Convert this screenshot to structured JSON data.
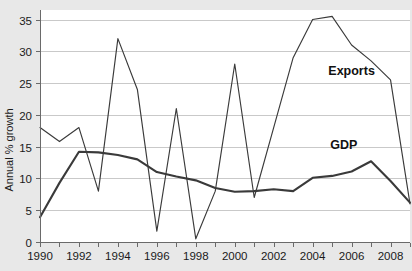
{
  "chart_data": {
    "type": "line",
    "title": "",
    "xlabel": "",
    "ylabel": "Annual % growth",
    "ylim": [
      0,
      36.5
    ],
    "xlim": [
      1990,
      2009
    ],
    "grid": true,
    "legend_position": "inline-labels",
    "y_ticks": [
      0,
      5,
      10,
      15,
      20,
      25,
      30,
      35
    ],
    "y_tick_labels": [
      "0",
      "5",
      "10",
      "15",
      "20",
      "25",
      "30",
      "35"
    ],
    "x": [
      1990,
      1991,
      1992,
      1993,
      1994,
      1995,
      1996,
      1997,
      1998,
      1999,
      2000,
      2001,
      2002,
      2003,
      2004,
      2005,
      2006,
      2007,
      2008,
      2009
    ],
    "x_tick_labels": [
      "1990",
      "1992",
      "1994",
      "1996",
      "1998",
      "2000",
      "2002",
      "2004",
      "2006",
      "2008"
    ],
    "x_labeled_years": [
      1990,
      1992,
      1994,
      1996,
      1998,
      2000,
      2002,
      2004,
      2006,
      2008
    ],
    "series": [
      {
        "name": "Exports",
        "label": "Exports",
        "color": "#3a3a3a",
        "values": [
          18.0,
          15.8,
          18.0,
          8.0,
          32.0,
          24.0,
          1.7,
          21.0,
          0.5,
          8.0,
          28.0,
          7.0,
          18.0,
          29.0,
          35.0,
          35.5,
          31.0,
          28.5,
          25.5,
          6.0
        ]
      },
      {
        "name": "GDP",
        "label": "GDP",
        "color": "#3a3a3a",
        "values": [
          3.9,
          9.3,
          14.2,
          14.1,
          13.7,
          13.0,
          11.0,
          10.3,
          9.7,
          8.5,
          7.9,
          8.0,
          8.3,
          8.0,
          10.1,
          10.4,
          11.1,
          12.7,
          9.6,
          6.2
        ]
      }
    ],
    "annotations": [
      {
        "text": "Exports",
        "x": 2006.0,
        "y": 26.3
      },
      {
        "text": "GDP",
        "x": 2005.6,
        "y": 14.6
      }
    ]
  }
}
